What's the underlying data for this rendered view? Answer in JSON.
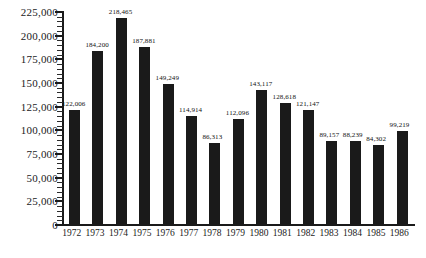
{
  "chart_data": {
    "type": "bar",
    "title": "",
    "subtitle": "",
    "xlabel": "",
    "ylabel": "",
    "categories": [
      "1972",
      "1973",
      "1974",
      "1975",
      "1976",
      "1977",
      "1978",
      "1979",
      "1980",
      "1981",
      "1982",
      "1983",
      "1984",
      "1985",
      "1986"
    ],
    "values": [
      122006,
      184200,
      218465,
      187881,
      149249,
      114914,
      86313,
      112096,
      143117,
      128618,
      121147,
      89157,
      88239,
      84302,
      99219
    ],
    "value_labels": [
      "122,006",
      "184,200",
      "218,465",
      "187,881",
      "149,249",
      "114,914",
      "86,313",
      "112,096",
      "143,117",
      "128,618",
      "121,147",
      "89,157",
      "88,239",
      "84,302",
      "99,219"
    ],
    "ylim": [
      0,
      225000
    ],
    "ytick_values": [
      0,
      25000,
      50000,
      75000,
      100000,
      125000,
      150000,
      175000,
      200000,
      225000
    ],
    "ytick_labels": [
      "0",
      "25,000",
      "50,000",
      "75,000",
      "100,000",
      "125,000",
      "150,000",
      "175,000",
      "200,000",
      "225,000"
    ],
    "y_minor_ticks_per_major": 5,
    "grid": false,
    "legend": null,
    "legend_position": "none",
    "bar_color": "#1a1a1a",
    "axis_color": "#1a1a1a",
    "background_color": "#ffffff",
    "show_value_labels": true
  }
}
